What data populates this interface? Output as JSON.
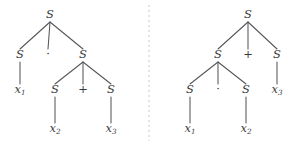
{
  "figure": {
    "background_color": "#ffffff",
    "text_color": "#3a3a3c",
    "edge_color": "#55565a",
    "divider_color": "#c9c9cc",
    "width": 298,
    "height": 150
  },
  "divider": {
    "name": "dashed-vertical-divider",
    "x": 149,
    "y1": 5,
    "y2": 141,
    "style": "dashed"
  },
  "trees": [
    {
      "id": "left-tree",
      "caption": "",
      "nodes": [
        {
          "id": "L-root",
          "label": "S",
          "kind": "nonterminal",
          "x": 50,
          "y": 18
        },
        {
          "id": "L-a",
          "label": "S",
          "kind": "nonterminal",
          "x": 20,
          "y": 58
        },
        {
          "id": "L-dot",
          "label": "·",
          "kind": "operator",
          "x": 48,
          "y": 58
        },
        {
          "id": "L-b",
          "label": "S",
          "kind": "nonterminal",
          "x": 83,
          "y": 58
        },
        {
          "id": "L-x1",
          "label": "x",
          "sub": "1",
          "kind": "terminal",
          "x": 20,
          "y": 93
        },
        {
          "id": "L-c",
          "label": "S",
          "kind": "nonterminal",
          "x": 55,
          "y": 93
        },
        {
          "id": "L-plus",
          "label": "+",
          "kind": "operator",
          "x": 83,
          "y": 93
        },
        {
          "id": "L-d",
          "label": "S",
          "kind": "nonterminal",
          "x": 111,
          "y": 93
        },
        {
          "id": "L-x2",
          "label": "x",
          "sub": "2",
          "kind": "terminal",
          "x": 55,
          "y": 132
        },
        {
          "id": "L-x3",
          "label": "x",
          "sub": "3",
          "kind": "terminal",
          "x": 111,
          "y": 132
        }
      ],
      "edges": [
        {
          "from": "L-root",
          "to": "L-a"
        },
        {
          "from": "L-root",
          "to": "L-dot"
        },
        {
          "from": "L-root",
          "to": "L-b"
        },
        {
          "from": "L-a",
          "to": "L-x1"
        },
        {
          "from": "L-b",
          "to": "L-c"
        },
        {
          "from": "L-b",
          "to": "L-plus"
        },
        {
          "from": "L-b",
          "to": "L-d"
        },
        {
          "from": "L-c",
          "to": "L-x2"
        },
        {
          "from": "L-d",
          "to": "L-x3"
        }
      ]
    },
    {
      "id": "right-tree",
      "caption": "",
      "nodes": [
        {
          "id": "R-root",
          "label": "S",
          "kind": "nonterminal",
          "x": 248,
          "y": 18
        },
        {
          "id": "R-a",
          "label": "S",
          "kind": "nonterminal",
          "x": 218,
          "y": 58
        },
        {
          "id": "R-plus",
          "label": "+",
          "kind": "operator",
          "x": 248,
          "y": 58
        },
        {
          "id": "R-b",
          "label": "S",
          "kind": "nonterminal",
          "x": 277,
          "y": 58
        },
        {
          "id": "R-c",
          "label": "S",
          "kind": "nonterminal",
          "x": 190,
          "y": 93
        },
        {
          "id": "R-dot",
          "label": "·",
          "kind": "operator",
          "x": 218,
          "y": 93
        },
        {
          "id": "R-d",
          "label": "S",
          "kind": "nonterminal",
          "x": 246,
          "y": 93
        },
        {
          "id": "R-x3",
          "label": "x",
          "sub": "3",
          "kind": "terminal",
          "x": 277,
          "y": 93
        },
        {
          "id": "R-x1",
          "label": "x",
          "sub": "1",
          "kind": "terminal",
          "x": 190,
          "y": 132
        },
        {
          "id": "R-x2",
          "label": "x",
          "sub": "2",
          "kind": "terminal",
          "x": 246,
          "y": 132
        }
      ],
      "edges": [
        {
          "from": "R-root",
          "to": "R-a"
        },
        {
          "from": "R-root",
          "to": "R-plus"
        },
        {
          "from": "R-root",
          "to": "R-b"
        },
        {
          "from": "R-a",
          "to": "R-c"
        },
        {
          "from": "R-a",
          "to": "R-dot"
        },
        {
          "from": "R-a",
          "to": "R-d"
        },
        {
          "from": "R-b",
          "to": "R-x3"
        },
        {
          "from": "R-c",
          "to": "R-x1"
        },
        {
          "from": "R-d",
          "to": "R-x2"
        }
      ]
    }
  ]
}
